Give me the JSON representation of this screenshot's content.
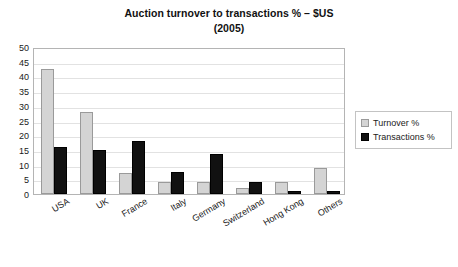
{
  "chart_data": {
    "type": "bar",
    "title": "Auction turnover to transactions % – $US",
    "subtitle": "(2005)",
    "xlabel": "",
    "ylabel": "",
    "ylim": [
      0,
      50
    ],
    "ytick_step": 5,
    "yticks": [
      "50",
      "45",
      "40",
      "35",
      "30",
      "25",
      "20",
      "15",
      "10",
      "5",
      "0"
    ],
    "grid": true,
    "legend_position": "right",
    "categories": [
      "USA",
      "UK",
      "France",
      "Italy",
      "Germany",
      "Switzerland",
      "Hong Kong",
      "Others"
    ],
    "series": [
      {
        "name": "Turnover %",
        "color": "#d4d4d4",
        "values": [
          42.5,
          28.0,
          7.0,
          4.0,
          4.0,
          2.0,
          4.0,
          9.0
        ]
      },
      {
        "name": "Transactions %",
        "color": "#111111",
        "values": [
          16.0,
          15.0,
          18.0,
          7.5,
          13.5,
          4.0,
          1.0,
          1.0
        ]
      }
    ]
  },
  "legend": {
    "items": [
      {
        "label": "Turnover %",
        "swatch": "turnover-swatch"
      },
      {
        "label": "Transactions %",
        "swatch": "transactions-swatch"
      }
    ]
  },
  "bottom_caption": ""
}
